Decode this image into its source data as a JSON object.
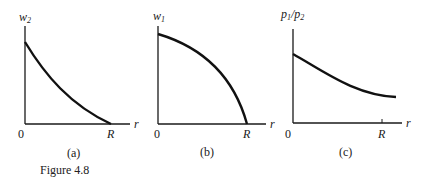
{
  "figure": {
    "caption": "Figure 4.8",
    "panels": [
      {
        "id": "a",
        "label": "(a)",
        "y_axis_label": "w",
        "y_axis_subscript": "2",
        "x_axis_label": "r",
        "origin_label": "0",
        "x_marker_label": "R",
        "curve": "convex decreasing, reaching zero at R"
      },
      {
        "id": "b",
        "label": "(b)",
        "y_axis_label": "w",
        "y_axis_subscript": "1",
        "x_axis_label": "r",
        "origin_label": "0",
        "x_marker_label": "R",
        "curve": "concave decreasing, reaching zero at R"
      },
      {
        "id": "c",
        "label": "(c)",
        "y_axis_label_num": "p",
        "y_axis_label_num_sub": "1",
        "y_axis_label_sep": "/",
        "y_axis_label_den": "p",
        "y_axis_label_den_sub": "2",
        "x_axis_label": "r",
        "origin_label": "0",
        "x_marker_label": "R",
        "curve": "convex decreasing, staying positive past R"
      }
    ]
  }
}
